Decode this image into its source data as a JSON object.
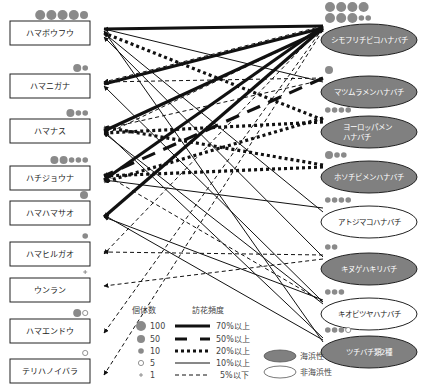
{
  "plants": [
    {
      "id": "p0",
      "name": "ハマボウフウ",
      "counts": [
        "100",
        "100",
        "100",
        "100",
        "50"
      ]
    },
    {
      "id": "p1",
      "name": "ハマニガナ",
      "counts": [
        "50",
        "10"
      ]
    },
    {
      "id": "p2",
      "name": "ハマナス",
      "counts": [
        "50",
        "10",
        "10"
      ]
    },
    {
      "id": "p3",
      "name": "ハチジョウナ",
      "counts": [
        "50",
        "50",
        "10",
        "10",
        "10"
      ]
    },
    {
      "id": "p4",
      "name": "ハマハマサオ",
      "counts": [
        "50"
      ]
    },
    {
      "id": "p5",
      "name": "ハマヒルガオ",
      "counts": [
        "10"
      ]
    },
    {
      "id": "p6",
      "name": "ウンラン",
      "counts": [
        "1"
      ]
    },
    {
      "id": "p7",
      "name": "ハマエンドウ",
      "counts": [
        "50",
        "5"
      ]
    },
    {
      "id": "p8",
      "name": "テリハノイバラ",
      "counts": [
        "5"
      ]
    }
  ],
  "bees": [
    {
      "id": "b0",
      "name": "シモフリチビコハナバチ",
      "type": "seaside",
      "counts": [
        "100",
        "100",
        "100",
        "100",
        "100",
        "100",
        "100",
        "10",
        "10"
      ]
    },
    {
      "id": "b1",
      "name": "マツムラメンハナバチ",
      "type": "seaside",
      "counts": [
        "50"
      ]
    },
    {
      "id": "b2",
      "name": "ヨーロッパメン",
      "name2": "ハナバチ",
      "type": "seaside",
      "counts": [
        "10",
        "10",
        "10",
        "10"
      ]
    },
    {
      "id": "b3",
      "name": "ホソチビメンハナバチ",
      "type": "seaside",
      "counts": [
        "50",
        "10",
        "10"
      ]
    },
    {
      "id": "b4",
      "name": "アトジマコハナバチ",
      "type": "non-seaside",
      "counts": [
        "10",
        "10",
        "10",
        "10"
      ]
    },
    {
      "id": "b5",
      "name": "キヌゲハキリバチ",
      "type": "seaside",
      "counts": [
        "10",
        "10"
      ]
    },
    {
      "id": "b6",
      "name": "キオビツヤハナバチ",
      "type": "non-seaside",
      "counts": [
        "10",
        "10",
        "10"
      ]
    },
    {
      "id": "b7",
      "name": "ツチバチ類2種",
      "type": "seaside",
      "counts": [
        "10",
        "10",
        "10",
        "5"
      ]
    }
  ],
  "links": [
    {
      "from": "b0",
      "to": "p0",
      "freq": "70"
    },
    {
      "from": "b0",
      "to": "p1",
      "freq": "70"
    },
    {
      "from": "b0",
      "to": "p2",
      "freq": "70"
    },
    {
      "from": "b0",
      "to": "p3",
      "freq": "70"
    },
    {
      "from": "b0",
      "to": "p4",
      "freq": "70"
    },
    {
      "from": "b1",
      "to": "p0",
      "freq": "10"
    },
    {
      "from": "b1",
      "to": "p3",
      "freq": "50"
    },
    {
      "from": "b2",
      "to": "p0",
      "freq": "20"
    },
    {
      "from": "b2",
      "to": "p2",
      "freq": "20"
    },
    {
      "from": "b2",
      "to": "p3",
      "freq": "20"
    },
    {
      "from": "b3",
      "to": "p2",
      "freq": "20"
    },
    {
      "from": "b3",
      "to": "p3",
      "freq": "20"
    },
    {
      "from": "b0",
      "to": "p5",
      "freq": "5"
    },
    {
      "from": "b0",
      "to": "p7",
      "freq": "5"
    },
    {
      "from": "b0",
      "to": "p8",
      "freq": "5"
    },
    {
      "from": "b0",
      "to": "p1",
      "freq": "5"
    },
    {
      "from": "b1",
      "to": "p2",
      "freq": "5"
    },
    {
      "from": "b4",
      "to": "p0",
      "freq": "10"
    },
    {
      "from": "b4",
      "to": "p3",
      "freq": "10"
    },
    {
      "from": "b5",
      "to": "p0",
      "freq": "10"
    },
    {
      "from": "b5",
      "to": "p6",
      "freq": "5"
    },
    {
      "from": "b5",
      "to": "p5",
      "freq": "5"
    },
    {
      "from": "b6",
      "to": "p1",
      "freq": "10"
    },
    {
      "from": "b6",
      "to": "p2",
      "freq": "10"
    },
    {
      "from": "b6",
      "to": "p4",
      "freq": "10"
    },
    {
      "from": "b6",
      "to": "p3",
      "freq": "5"
    },
    {
      "from": "b7",
      "to": "p0",
      "freq": "10"
    },
    {
      "from": "b7",
      "to": "p2",
      "freq": "10"
    },
    {
      "from": "b7",
      "to": "p4",
      "freq": "10"
    },
    {
      "from": "b0",
      "to": "p2",
      "freq": "5"
    },
    {
      "from": "b1",
      "to": "p1",
      "freq": "5"
    }
  ],
  "legend": {
    "count_title": "個体数",
    "count_items": [
      {
        "key": "100",
        "label": "100"
      },
      {
        "key": "50",
        "label": "50"
      },
      {
        "key": "10",
        "label": "10"
      },
      {
        "key": "5",
        "label": "5"
      },
      {
        "key": "1",
        "label": "1"
      }
    ],
    "freq_title": "訪花頻度",
    "freq_items": [
      {
        "key": "70",
        "label": "70%以上"
      },
      {
        "key": "50",
        "label": "50%以上"
      },
      {
        "key": "20",
        "label": "20%以上"
      },
      {
        "key": "10",
        "label": "10%以上"
      },
      {
        "key": "5",
        "label": "5%以下"
      }
    ],
    "habitat_items": [
      {
        "key": "seaside",
        "label": "海浜性"
      },
      {
        "key": "non-seaside",
        "label": "非海浜性"
      }
    ]
  },
  "colors": {
    "seaside_fill": "#808080",
    "non_seaside_fill": "#ffffff",
    "line": "#111111",
    "dot": "#8a8a8a"
  }
}
